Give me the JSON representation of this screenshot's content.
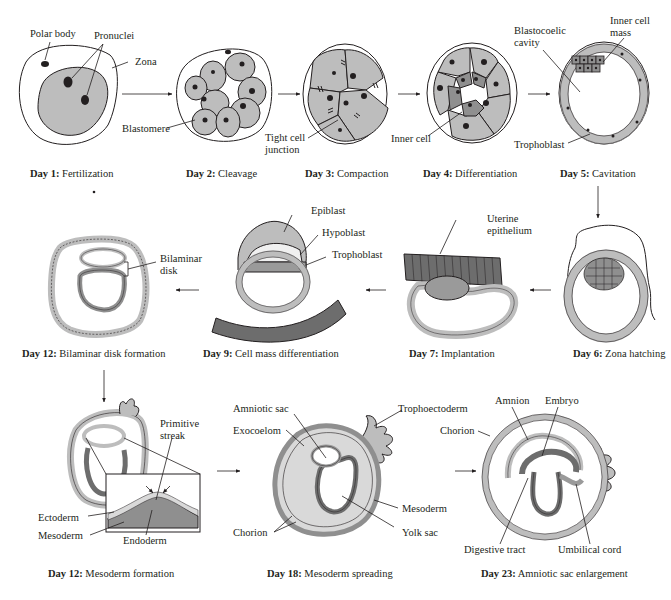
{
  "colors": {
    "cell_fill": "#bdbdbd",
    "dark_fill": "#6d6d6d",
    "mid_fill": "#9a9a9a",
    "light_fill": "#d9d9d9",
    "line": "#231f20",
    "background": "#ffffff"
  },
  "stages": [
    {
      "day": "Day 1:",
      "name": "Fertilization",
      "labels": [
        "Polar body",
        "Pronuclei",
        "Zona"
      ]
    },
    {
      "day": "Day 2:",
      "name": "Cleavage",
      "labels": [
        "Blastomere"
      ]
    },
    {
      "day": "Day 3:",
      "name": "Compaction",
      "labels": [
        "Tight cell",
        "junction"
      ]
    },
    {
      "day": "Day 4:",
      "name": "Differentiation",
      "labels": [
        "Inner cell"
      ]
    },
    {
      "day": "Day 5:",
      "name": "Cavitation",
      "labels": [
        "Blastocoelic",
        "cavity",
        "Inner cell",
        "mass",
        "Trophoblast"
      ]
    },
    {
      "day": "Day 6:",
      "name": "Zona hatching",
      "labels": []
    },
    {
      "day": "Day 7:",
      "name": "Implantation",
      "labels": [
        "Uterine",
        "epithelium"
      ]
    },
    {
      "day": "Day 9:",
      "name": "Cell mass differentiation",
      "labels": [
        "Epiblast",
        "Hypoblast",
        "Trophoblast"
      ]
    },
    {
      "day": "Day 12:",
      "name": "Bilaminar disk formation",
      "labels": [
        "Bilaminar",
        "disk"
      ]
    },
    {
      "day": "Day 12:",
      "name": "Mesoderm formation",
      "labels": [
        "Primitive",
        "streak",
        "Ectoderm",
        "Mesoderm",
        "Endoderm"
      ]
    },
    {
      "day": "Day 18:",
      "name": "Mesoderm spreading",
      "labels": [
        "Amniotic sac",
        "Exocoelom",
        "Trophoectoderm",
        "Mesoderm",
        "Chorion",
        "Yolk sac"
      ]
    },
    {
      "day": "Day 23:",
      "name": "Amniotic sac enlargement",
      "labels": [
        "Amnion",
        "Embryo",
        "Chorion",
        "Digestive tract",
        "Umbilical cord"
      ]
    }
  ],
  "flow_arrows": [
    "day1-to-day2",
    "day2-to-day3",
    "day3-to-day4",
    "day4-to-day5",
    "day5-to-day6",
    "day6-to-day7",
    "day7-to-day9",
    "day9-to-day12",
    "day12-to-day12-mesoderm",
    "day12-to-day18",
    "day18-to-day23"
  ]
}
